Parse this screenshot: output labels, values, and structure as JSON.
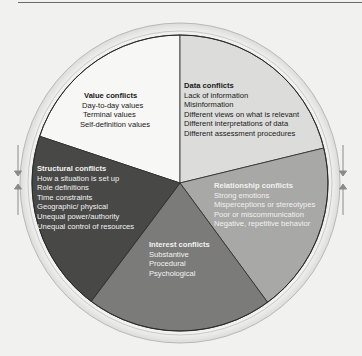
{
  "diagram": {
    "type": "circle-of-conflict",
    "colors": {
      "background": "#f1f1f0",
      "ring": "#e4e4e2",
      "value": "#f7f7f5",
      "data": "#dcdcdb",
      "relationship": "#a8a8a7",
      "interest": "#7b7b7a",
      "structural": "#484847",
      "divider": "#2a2a2a"
    },
    "segments": [
      {
        "id": "value",
        "title": "Value conflicts",
        "items": [
          "Day-to-day values",
          "Terminal values",
          "Self-definition values"
        ]
      },
      {
        "id": "data",
        "title": "Data conflicts",
        "items": [
          "Lack of information",
          "Misinformation",
          "Different views on what is relevant",
          "Different interpretations of data",
          "Different assessment procedures"
        ]
      },
      {
        "id": "relationship",
        "title": "Relationship conflicts",
        "items": [
          "Strong emotions",
          "Misperceptions or stereotypes",
          "Poor or miscommunication",
          "Negative, repetitive behavior"
        ]
      },
      {
        "id": "interest",
        "title": "Interest conflicts",
        "items": [
          "Substantive",
          "Procedural",
          "Psychological"
        ]
      },
      {
        "id": "structural",
        "title": "Structural conflicts",
        "items": [
          "How a situation is set up",
          "Role definitions",
          "Time constraints",
          "Geographic/ physical",
          "Unequal power/authority",
          "Unequal control of resources"
        ]
      }
    ],
    "arrows": {
      "left": [
        "arrow-down",
        "arrow-up"
      ],
      "right": [
        "arrow-down",
        "arrow-up"
      ]
    }
  }
}
